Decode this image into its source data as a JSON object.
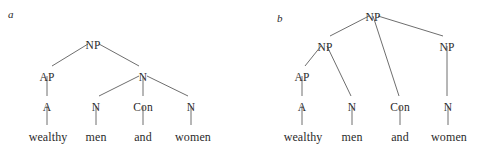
{
  "figure": {
    "width": 480,
    "height": 154,
    "background_color": "#ffffff",
    "line_color": "#6e6e6e",
    "text_color": "#2b2b2b",
    "sentence": "wealthy men and women"
  },
  "panels": [
    {
      "id": "a",
      "label": "a",
      "nodes": [
        {
          "name": "root-np",
          "text": "NP",
          "x": 93,
          "y": 40,
          "terminal": false
        },
        {
          "name": "ap",
          "text": "AP",
          "x": 47,
          "y": 72,
          "terminal": false
        },
        {
          "name": "n-coord",
          "text": "N",
          "x": 143,
          "y": 72,
          "terminal": false
        },
        {
          "name": "a",
          "text": "A",
          "x": 47,
          "y": 102,
          "terminal": false
        },
        {
          "name": "n-left",
          "text": "N",
          "x": 96,
          "y": 102,
          "terminal": false
        },
        {
          "name": "con",
          "text": "Con",
          "x": 143,
          "y": 102,
          "terminal": false
        },
        {
          "name": "n-right",
          "text": "N",
          "x": 191,
          "y": 102,
          "terminal": false
        },
        {
          "name": "word-wealthy",
          "text": "wealthy",
          "x": 48,
          "y": 131,
          "terminal": true
        },
        {
          "name": "word-men",
          "text": "men",
          "x": 96,
          "y": 131,
          "terminal": true
        },
        {
          "name": "word-and",
          "text": "and",
          "x": 143,
          "y": 131,
          "terminal": true
        },
        {
          "name": "word-women",
          "text": "women",
          "x": 193,
          "y": 131,
          "terminal": true
        }
      ],
      "edges": [
        {
          "name": "edge-root-to-ap",
          "x1": 88,
          "y1": 44,
          "x2": 52,
          "y2": 66
        },
        {
          "name": "edge-root-to-n",
          "x1": 99,
          "y1": 44,
          "x2": 139,
          "y2": 66
        },
        {
          "name": "edge-ap-to-a",
          "x1": 47,
          "y1": 76,
          "x2": 47,
          "y2": 96
        },
        {
          "name": "edge-n-to-nleft",
          "x1": 139,
          "y1": 76,
          "x2": 99,
          "y2": 96
        },
        {
          "name": "edge-n-to-con",
          "x1": 143,
          "y1": 76,
          "x2": 143,
          "y2": 96
        },
        {
          "name": "edge-n-to-nright",
          "x1": 147,
          "y1": 76,
          "x2": 188,
          "y2": 96
        },
        {
          "name": "edge-a-to-wealthy",
          "x1": 47,
          "y1": 106,
          "x2": 47,
          "y2": 125
        },
        {
          "name": "edge-nleft-to-men",
          "x1": 96,
          "y1": 106,
          "x2": 96,
          "y2": 125
        },
        {
          "name": "edge-con-to-and",
          "x1": 143,
          "y1": 106,
          "x2": 143,
          "y2": 125
        },
        {
          "name": "edge-nright-to-women",
          "x1": 191,
          "y1": 106,
          "x2": 191,
          "y2": 125
        }
      ]
    },
    {
      "id": "b",
      "label": "b",
      "nodes": [
        {
          "name": "root-np",
          "text": "NP",
          "x": 133,
          "y": 12,
          "terminal": false
        },
        {
          "name": "np-left",
          "text": "NP",
          "x": 85,
          "y": 42,
          "terminal": false
        },
        {
          "name": "np-right",
          "text": "NP",
          "x": 207,
          "y": 42,
          "terminal": false
        },
        {
          "name": "ap",
          "text": "AP",
          "x": 62,
          "y": 72,
          "terminal": false
        },
        {
          "name": "a",
          "text": "A",
          "x": 62,
          "y": 102,
          "terminal": false
        },
        {
          "name": "n-left",
          "text": "N",
          "x": 112,
          "y": 102,
          "terminal": false
        },
        {
          "name": "con",
          "text": "Con",
          "x": 160,
          "y": 102,
          "terminal": false
        },
        {
          "name": "n-right",
          "text": "N",
          "x": 208,
          "y": 102,
          "terminal": false
        },
        {
          "name": "word-wealthy",
          "text": "wealthy",
          "x": 63,
          "y": 131,
          "terminal": true
        },
        {
          "name": "word-men",
          "text": "men",
          "x": 112,
          "y": 131,
          "terminal": true
        },
        {
          "name": "word-and",
          "text": "and",
          "x": 160,
          "y": 131,
          "terminal": true
        },
        {
          "name": "word-women",
          "text": "women",
          "x": 209,
          "y": 131,
          "terminal": true
        }
      ],
      "edges": [
        {
          "name": "edge-root-to-npleft",
          "x1": 129,
          "y1": 16,
          "x2": 90,
          "y2": 36
        },
        {
          "name": "edge-root-to-con",
          "x1": 133,
          "y1": 16,
          "x2": 159,
          "y2": 96
        },
        {
          "name": "edge-root-to-npright",
          "x1": 138,
          "y1": 16,
          "x2": 203,
          "y2": 36
        },
        {
          "name": "edge-npleft-to-ap",
          "x1": 81,
          "y1": 46,
          "x2": 65,
          "y2": 66
        },
        {
          "name": "edge-npleft-to-nleft",
          "x1": 87,
          "y1": 46,
          "x2": 111,
          "y2": 96
        },
        {
          "name": "edge-npright-to-n",
          "x1": 207,
          "y1": 46,
          "x2": 207,
          "y2": 96
        },
        {
          "name": "edge-ap-to-a",
          "x1": 62,
          "y1": 76,
          "x2": 62,
          "y2": 96
        },
        {
          "name": "edge-a-to-wealthy",
          "x1": 62,
          "y1": 106,
          "x2": 62,
          "y2": 125
        },
        {
          "name": "edge-nleft-to-men",
          "x1": 112,
          "y1": 106,
          "x2": 112,
          "y2": 125
        },
        {
          "name": "edge-con-to-and",
          "x1": 160,
          "y1": 106,
          "x2": 160,
          "y2": 125
        },
        {
          "name": "edge-nright-to-women",
          "x1": 208,
          "y1": 106,
          "x2": 208,
          "y2": 125
        }
      ]
    }
  ]
}
